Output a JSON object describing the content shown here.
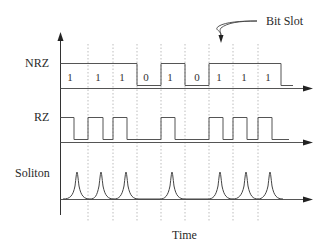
{
  "diagram": {
    "annotation": "Bit Slot",
    "x_axis_label": "Time",
    "rows": [
      {
        "name": "NRZ",
        "label": "NRZ"
      },
      {
        "name": "RZ",
        "label": "RZ"
      },
      {
        "name": "Soliton",
        "label": "Soliton"
      }
    ],
    "bits": [
      "1",
      "1",
      "1",
      "0",
      "1",
      "0",
      "1",
      "1",
      "1"
    ],
    "slot_boundaries_x": [
      61,
      88,
      113,
      137,
      161,
      185,
      209,
      233,
      258,
      282
    ],
    "colors": {
      "line": "#3a3a3a",
      "grid": "#9a9a9a",
      "text": "#2a2a2a"
    }
  }
}
